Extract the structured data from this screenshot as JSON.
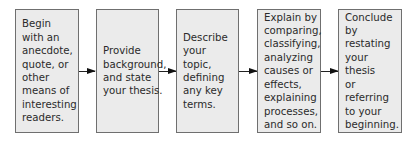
{
  "diagram": {
    "type": "flowchart",
    "direction": "left-to-right",
    "steps": [
      {
        "text": "Begin\nwith an\nanecdote,\nquote, or\nother\nmeans of\ninteresting\nreaders."
      },
      {
        "text": "Provide\nbackground,\nand state\nyour thesis."
      },
      {
        "text": "Describe\nyour topic,\ndefining\nany key\nterms."
      },
      {
        "text": "Explain by\ncomparing,\nclassifying,\nanalyzing\ncauses or\neffects,\nexplaining\nprocesses,\nand so on."
      },
      {
        "text": "Conclude by\nrestating\nyour thesis\nor referring\nto your\nbeginning."
      }
    ],
    "colors": {
      "box_fill": "#ebebeb",
      "box_border": "#6f6f6f",
      "arrow": "#111111",
      "text": "#2a2a2a"
    }
  }
}
